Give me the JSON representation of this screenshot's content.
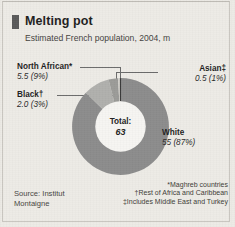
{
  "header": {
    "title": "Melting pot",
    "subtitle": "Estimated French population, 2004, m"
  },
  "center": {
    "total_label": "Total:",
    "total_value": "63"
  },
  "callouts": {
    "north_african": {
      "name": "North African*",
      "value": "5.5 (9%)"
    },
    "black": {
      "name": "Black†",
      "value": "2.0 (3%)"
    },
    "asian": {
      "name": "Asian‡",
      "value": "0.5 (1%)"
    },
    "white": {
      "name": "White",
      "value": "55 (87%)"
    }
  },
  "source": "Source: Institut Montaigne",
  "footnotes": [
    "*Maghreb countries",
    "†Rest of Africa and Caribbean",
    "‡Includes Middle East and Turkey"
  ],
  "colors": {
    "background": "#edebe6",
    "white_segment": "#8c8c8c",
    "north_african_segment": "#b0b0ad",
    "black_segment": "#9b9b98",
    "asian_segment": "#cfcdc8",
    "hole": "#f6f5f2",
    "text": "#1f1f1f"
  },
  "chart_data": {
    "type": "pie",
    "title": "Melting pot",
    "subtitle": "Estimated French population, 2004, m",
    "unit": "millions",
    "total": 63,
    "categories": [
      "White",
      "North African*",
      "Black†",
      "Asian‡"
    ],
    "values": [
      55,
      5.5,
      2.0,
      0.5
    ],
    "percentages": [
      87,
      9,
      3,
      1
    ],
    "labels": [
      "55 (87%)",
      "5.5 (9%)",
      "2.0 (3%)",
      "0.5 (1%)"
    ],
    "donut": true,
    "legend": "callout-labels",
    "grid": false
  }
}
